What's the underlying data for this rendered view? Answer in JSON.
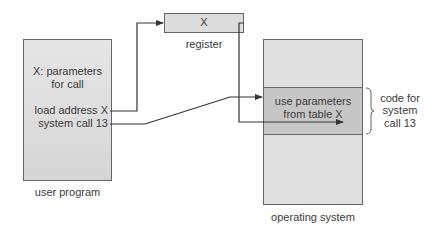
{
  "diagram": {
    "user_program": {
      "label": "user program",
      "line1": "X: parameters",
      "line2": "for call",
      "line3": "load address X",
      "line4": "system call 13"
    },
    "register": {
      "value": "X",
      "label": "register"
    },
    "operating_system": {
      "label": "operating system",
      "band_line1": "use parameters",
      "band_line2": "from table X"
    },
    "annotation": {
      "line1": "code for",
      "line2": "system",
      "line3": "call 13"
    },
    "colors": {
      "box_fill": "#dcdcdc",
      "band_fill": "#c4c4c4",
      "line": "#333333"
    }
  }
}
